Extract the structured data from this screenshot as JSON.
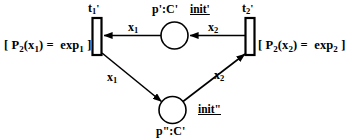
{
  "diagram": {
    "type": "petri-net",
    "title": "",
    "background_color": "#ffffff",
    "stroke_color": "#000000"
  },
  "transitions": [
    {
      "id": "t1",
      "name_base": "t",
      "name_sub": "1",
      "name_prime": "'",
      "label": "t1'",
      "guard": "[ P2(x1) =  exp1 ]",
      "guard_parts": {
        "open": "[ P",
        "p_sub": "2",
        "arg_open": "(x",
        "arg_sub": "1",
        "arg_close": ") =",
        "exp": "exp",
        "exp_sub": "1",
        "close": "]"
      }
    },
    {
      "id": "t2",
      "name_base": "t",
      "name_sub": "2",
      "name_prime": "'",
      "label": "t2'",
      "guard": "[ P2(x2) =  exp2 ]",
      "guard_parts": {
        "open": "[ P",
        "p_sub": "2",
        "arg_open": "(x",
        "arg_sub": "2",
        "arg_close": ") =",
        "exp": "exp",
        "exp_sub": "2",
        "close": "]"
      }
    }
  ],
  "places": [
    {
      "id": "p-top",
      "label": "p':C'",
      "init": "init'",
      "tokens": 0
    },
    {
      "id": "p-bottom",
      "label": "p\":C'",
      "init": "init\"",
      "tokens": 0
    }
  ],
  "arcs": [
    {
      "id": "arc-top-left",
      "from": "p-top",
      "to": "t1",
      "var_base": "x",
      "var_sub": "1",
      "label": "x1",
      "direction": "left"
    },
    {
      "id": "arc-top-right",
      "from": "t2",
      "to": "p-top",
      "var_base": "x",
      "var_sub": "2",
      "label": "x2",
      "direction": "left"
    },
    {
      "id": "arc-bottom-left",
      "from": "t1",
      "to": "p-bottom",
      "var_base": "x",
      "var_sub": "1",
      "label": "x1",
      "direction": "down-right"
    },
    {
      "id": "arc-bottom-right",
      "from": "p-bottom",
      "to": "t2",
      "var_base": "x",
      "var_sub": "2",
      "label": "x2",
      "direction": "up-right"
    }
  ]
}
